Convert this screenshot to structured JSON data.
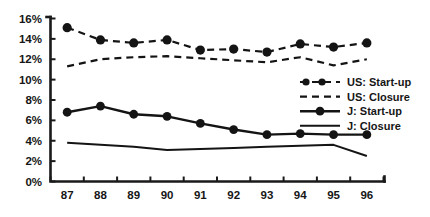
{
  "chart_data": {
    "type": "line",
    "title": "",
    "subtitle": "",
    "xlabel": "",
    "ylabel": "",
    "x": [
      "87",
      "88",
      "89",
      "90",
      "91",
      "92",
      "93",
      "94",
      "95",
      "96"
    ],
    "categories": [
      "87",
      "88",
      "89",
      "90",
      "91",
      "92",
      "93",
      "94",
      "95",
      "96"
    ],
    "ylim": [
      0,
      16
    ],
    "ytick_labels": [
      "0%",
      "2%",
      "4%",
      "6%",
      "8%",
      "10%",
      "12%",
      "14%",
      "16%"
    ],
    "ytick_values": [
      0,
      2,
      4,
      6,
      8,
      10,
      12,
      14,
      16
    ],
    "grid": false,
    "legend_position": "center-right",
    "series": [
      {
        "name": "US: Start-up",
        "style": "dashed-with-markers",
        "values": [
          15.1,
          13.9,
          13.6,
          13.9,
          12.9,
          13.0,
          12.7,
          13.5,
          13.2,
          13.6
        ]
      },
      {
        "name": "US: Closure",
        "style": "dashed",
        "values": [
          11.3,
          12.0,
          12.2,
          12.3,
          12.1,
          11.9,
          11.7,
          12.2,
          11.4,
          12.0
        ]
      },
      {
        "name": "J: Start-up",
        "style": "solid-with-markers",
        "values": [
          6.8,
          7.4,
          6.6,
          6.4,
          5.7,
          5.1,
          4.6,
          4.7,
          4.6,
          4.6
        ]
      },
      {
        "name": "J: Closure",
        "style": "solid",
        "values": [
          3.8,
          3.6,
          3.4,
          3.1,
          3.2,
          3.3,
          3.4,
          3.5,
          3.6,
          2.5
        ]
      }
    ]
  },
  "legend": {
    "items": [
      {
        "label": "US: Start-up",
        "marker": "dashed-dot-icon"
      },
      {
        "label": "US: Closure",
        "marker": "dashed-icon"
      },
      {
        "label": "J: Start-up",
        "marker": "solid-dot-icon"
      },
      {
        "label": "J: Closure",
        "marker": "solid-icon"
      }
    ]
  },
  "colors": {
    "ink": "#141414",
    "background": "#ffffff"
  }
}
